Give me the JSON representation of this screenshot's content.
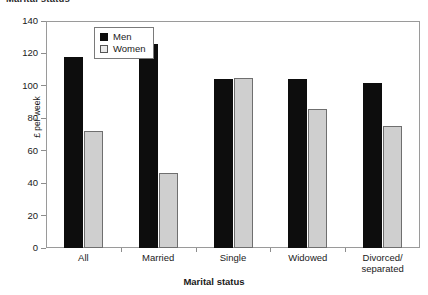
{
  "chart_data": {
    "type": "bar",
    "title": "Marital status",
    "title_truncated": true,
    "xlabel": "Marital status",
    "ylabel": "£ per week",
    "categories": [
      "All",
      "Married",
      "Single",
      "Widowed",
      "Divorced/\nseparated"
    ],
    "category_labels": [
      {
        "line1": "All",
        "line2": ""
      },
      {
        "line1": "Married",
        "line2": ""
      },
      {
        "line1": "Single",
        "line2": ""
      },
      {
        "line1": "Widowed",
        "line2": ""
      },
      {
        "line1": "Divorced/",
        "line2": "separated"
      }
    ],
    "series": [
      {
        "name": "Men",
        "color": "#0d0d0d",
        "values": [
          118,
          126,
          104,
          104,
          102
        ]
      },
      {
        "name": "Women",
        "color": "#cfcfcf",
        "values": [
          72,
          46,
          105,
          86,
          75
        ]
      }
    ],
    "ylim": [
      0,
      140
    ],
    "ytick_values": [
      140,
      120,
      100,
      80,
      60,
      40,
      20,
      0
    ],
    "ytick_labels": [
      "140",
      "120",
      "100",
      "80",
      "60",
      "40",
      "20",
      "0"
    ],
    "grid": false,
    "legend_position": "upper-left-inside"
  },
  "legend": {
    "entries": [
      {
        "label": "Men"
      },
      {
        "label": "Women"
      }
    ]
  }
}
